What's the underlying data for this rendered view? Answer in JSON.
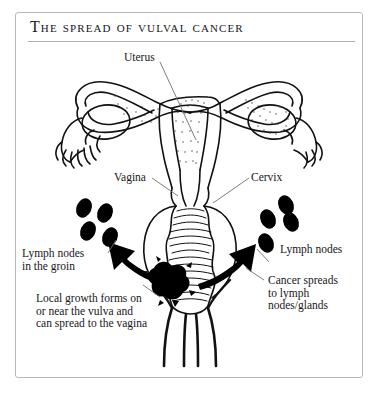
{
  "figure": {
    "title": "The spread of vulval cancer",
    "frame_color": "#b9b9bd",
    "rule_color": "#b0b0b4",
    "background": "#ffffff",
    "ink_color": "#000000",
    "type": "anatomical-line-diagram"
  },
  "labels": {
    "uterus": "Uterus",
    "vagina": "Vagina",
    "cervix": "Cervix",
    "lymph_nodes_groin_line1": "Lymph nodes",
    "lymph_nodes_groin_line2": "in the groin",
    "lymph_nodes_right": "Lymph nodes",
    "local_growth_line1": "Local growth forms on",
    "local_growth_line2": "or near the vulva and",
    "local_growth_line3": "can spread to the vagina",
    "cancer_spreads_line1": "Cancer spreads",
    "cancer_spreads_line2": "to lymph",
    "cancer_spreads_line3": "nodes/glands"
  },
  "anatomy": {
    "uterus_label_target": "uterine body",
    "vagina_label_target": "vaginal canal",
    "cervix_label_target": "cervix",
    "tumour": "vulval tumour mass",
    "lymph_node_count_left": 4,
    "lymph_node_count_right": 4,
    "arrows": [
      "spread-arrow-left",
      "spread-arrow-right"
    ]
  }
}
